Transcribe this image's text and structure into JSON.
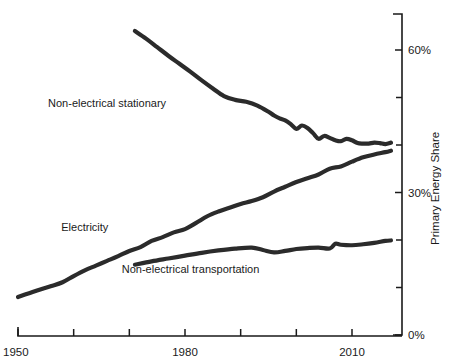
{
  "chart_data": {
    "type": "line",
    "title": "",
    "xlabel": "",
    "ylabel": "Primary Energy Share",
    "xlim": [
      1950,
      2020
    ],
    "ylim": [
      0,
      70
    ],
    "grid": false,
    "legend_position": "inline-labels",
    "x_tick_labels": [
      "1950",
      "1980",
      "2010"
    ],
    "x_tick_values": [
      1950,
      1980,
      2010
    ],
    "x_minor_tick_values": [
      1960,
      1970,
      1990,
      2000
    ],
    "y_tick_labels": [
      "0%",
      "30%",
      "60%"
    ],
    "y_tick_values": [
      0,
      30,
      60
    ],
    "y_minor_tick_values": [
      10,
      20,
      40,
      50
    ],
    "series": [
      {
        "name": "Non-electrical stationary",
        "label": "Non-electrical stationary",
        "label_x": 1966,
        "label_y": 48,
        "x": [
          1971,
          1973,
          1975,
          1977,
          1979,
          1981,
          1983,
          1985,
          1987,
          1989,
          1991,
          1993,
          1995,
          1996,
          1997,
          1998,
          1999,
          2000,
          2001,
          2002,
          2003,
          2004,
          2005,
          2006,
          2007,
          2008,
          2009,
          2010,
          2011,
          2012,
          2013,
          2014,
          2015,
          2016,
          2017
        ],
        "y": [
          64.0,
          62.4,
          60.6,
          58.8,
          57.1,
          55.4,
          53.6,
          51.9,
          50.3,
          49.5,
          49.1,
          48.3,
          47.0,
          46.2,
          45.6,
          45.2,
          44.4,
          43.4,
          44.1,
          43.6,
          42.5,
          41.3,
          41.9,
          41.5,
          41.0,
          40.8,
          41.3,
          41.0,
          40.4,
          40.3,
          40.3,
          40.5,
          40.4,
          40.2,
          40.5
        ]
      },
      {
        "name": "Electricity",
        "label": "Electricity",
        "label_x": 1962,
        "label_y": 22,
        "x": [
          1950,
          1952,
          1954,
          1956,
          1958,
          1960,
          1962,
          1964,
          1966,
          1968,
          1970,
          1972,
          1974,
          1976,
          1978,
          1980,
          1982,
          1984,
          1986,
          1988,
          1990,
          1992,
          1994,
          1996,
          1998,
          2000,
          2002,
          2004,
          2006,
          2008,
          2010,
          2012,
          2014,
          2016,
          2017
        ],
        "y": [
          8.0,
          8.8,
          9.6,
          10.3,
          11.1,
          12.4,
          13.6,
          14.6,
          15.6,
          16.6,
          17.7,
          18.5,
          19.8,
          20.6,
          21.6,
          22.3,
          23.6,
          25.0,
          26.0,
          26.8,
          27.6,
          28.2,
          29.0,
          30.2,
          31.2,
          32.2,
          33.0,
          33.8,
          35.0,
          35.5,
          36.5,
          37.4,
          38.0,
          38.5,
          38.8
        ]
      },
      {
        "name": "Non-electrical transportation",
        "label": "Non-electrical transportation",
        "label_x": 1981,
        "label_y": 13,
        "x": [
          1971,
          1974,
          1977,
          1980,
          1983,
          1986,
          1989,
          1992,
          1994,
          1996,
          1998,
          2000,
          2002,
          2004,
          2006,
          2007,
          2008,
          2010,
          2012,
          2014,
          2016,
          2017
        ],
        "y": [
          14.8,
          15.5,
          16.1,
          16.7,
          17.3,
          17.8,
          18.2,
          18.4,
          17.9,
          17.4,
          17.7,
          18.1,
          18.3,
          18.4,
          18.2,
          19.2,
          19.0,
          18.9,
          19.1,
          19.4,
          19.8,
          19.9
        ]
      }
    ]
  },
  "axis": {
    "y_title": "Primary Energy Share"
  },
  "colors": {
    "line": "#2b2b2b",
    "axis": "#1a1a1a",
    "text": "#1a1a1a",
    "background": "#ffffff"
  }
}
